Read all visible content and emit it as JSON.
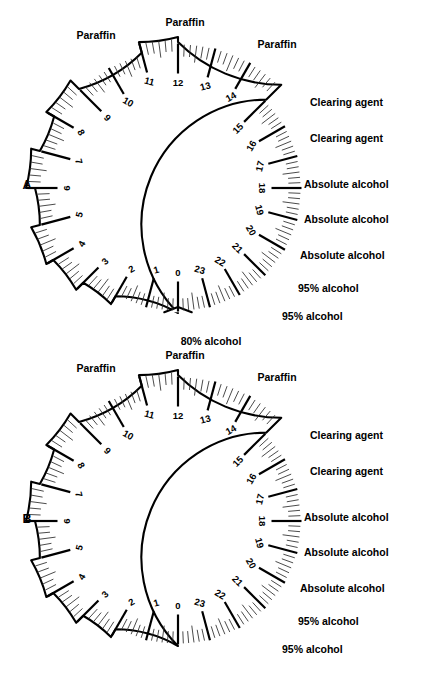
{
  "figure": {
    "background_color": "#ffffff",
    "ink_color": "#000000",
    "panels": [
      {
        "id": "A",
        "letter": "A",
        "center": {
          "x": 178,
          "y": 188
        },
        "inner_radius": 125,
        "letter_pos": {
          "x": 27,
          "y": 189
        },
        "has_bottom_notch": true,
        "hours": [
          0,
          1,
          2,
          3,
          4,
          5,
          6,
          7,
          8,
          9,
          10,
          11,
          12,
          13,
          14,
          15,
          16,
          17,
          18,
          19,
          20,
          21,
          22,
          23
        ],
        "hour_labels": [
          "0",
          "1",
          "2",
          "3",
          "4",
          "5",
          "6",
          "7",
          "8",
          "9",
          "10",
          "11",
          "12",
          "13",
          "14",
          "15",
          "16",
          "17",
          "18",
          "19",
          "20",
          "21",
          "22",
          "23"
        ],
        "steps": [
          {
            "from_hour": 0,
            "to_hour": 2,
            "radius": 125,
            "station": "80% alcohol"
          },
          {
            "from_hour": 2,
            "to_hour": 3,
            "radius": 134,
            "station": "95% alcohol"
          },
          {
            "from_hour": 3,
            "to_hour": 4,
            "radius": 144,
            "station": "95% alcohol"
          },
          {
            "from_hour": 4,
            "to_hour": 5,
            "radius": 152,
            "station": "Absolute alcohol"
          },
          {
            "from_hour": 5,
            "to_hour": 6,
            "radius": 143,
            "station": "Absolute alcohol"
          },
          {
            "from_hour": 6,
            "to_hour": 7,
            "radius": 152,
            "station": "Absolute alcohol"
          },
          {
            "from_hour": 7,
            "to_hour": 8,
            "radius": 143,
            "station": "Clearing agent"
          },
          {
            "from_hour": 8,
            "to_hour": 9,
            "radius": 152,
            "station": "Clearing agent"
          },
          {
            "from_hour": 9,
            "to_hour": 11,
            "radius": 140,
            "station": "Paraffin"
          },
          {
            "from_hour": 11,
            "to_hour": 12,
            "radius": 151,
            "station": "Paraffin"
          },
          {
            "from_hour": 12,
            "to_hour": 15,
            "radius": 146,
            "station": "Paraffin"
          },
          {
            "from_hour": 15,
            "to_hour": 24,
            "radius": 125,
            "station": ""
          }
        ],
        "side_labels": [
          {
            "text": "Clearing agent",
            "x": 310,
            "y": 106
          },
          {
            "text": "Clearing agent",
            "x": 310,
            "y": 142
          },
          {
            "text": "Absolute alcohol",
            "x": 304,
            "y": 188
          },
          {
            "text": "Absolute alcohol",
            "x": 304,
            "y": 223
          },
          {
            "text": "Absolute alcohol",
            "x": 300,
            "y": 259
          },
          {
            "text": "95% alcohol",
            "x": 298,
            "y": 292
          },
          {
            "text": "95% alcohol",
            "x": 282,
            "y": 320
          }
        ],
        "top_labels": [
          {
            "text": "Paraffin",
            "x": 96,
            "y": 39
          },
          {
            "text": "Paraffin",
            "x": 185,
            "y": 26
          },
          {
            "text": "Paraffin",
            "x": 277,
            "y": 48
          }
        ],
        "bottom_labels": [
          {
            "text": "80% alcohol",
            "x": 211,
            "y": 345
          }
        ]
      },
      {
        "id": "B",
        "letter": "B",
        "center": {
          "x": 178,
          "y": 521
        },
        "inner_radius": 125,
        "letter_pos": {
          "x": 27,
          "y": 523
        },
        "has_bottom_notch": false,
        "hours": [
          0,
          1,
          2,
          3,
          4,
          5,
          6,
          7,
          8,
          9,
          10,
          11,
          12,
          13,
          14,
          15,
          16,
          17,
          18,
          19,
          20,
          21,
          22,
          23
        ],
        "hour_labels": [
          "0",
          "1",
          "2",
          "3",
          "4",
          "5",
          "6",
          "7",
          "8",
          "9",
          "10",
          "11",
          "12",
          "13",
          "14",
          "15",
          "16",
          "17",
          "18",
          "19",
          "20",
          "21",
          "22",
          "23"
        ],
        "steps": [
          {
            "from_hour": 0,
            "to_hour": 2,
            "radius": 125,
            "station": ""
          },
          {
            "from_hour": 2,
            "to_hour": 3,
            "radius": 134,
            "station": "95% alcohol"
          },
          {
            "from_hour": 3,
            "to_hour": 4,
            "radius": 144,
            "station": "95% alcohol"
          },
          {
            "from_hour": 4,
            "to_hour": 5,
            "radius": 152,
            "station": "Absolute alcohol"
          },
          {
            "from_hour": 5,
            "to_hour": 6,
            "radius": 143,
            "station": "Absolute alcohol"
          },
          {
            "from_hour": 6,
            "to_hour": 7,
            "radius": 152,
            "station": "Absolute alcohol"
          },
          {
            "from_hour": 7,
            "to_hour": 8,
            "radius": 143,
            "station": "Clearing agent"
          },
          {
            "from_hour": 8,
            "to_hour": 9,
            "radius": 152,
            "station": "Clearing agent"
          },
          {
            "from_hour": 9,
            "to_hour": 11,
            "radius": 140,
            "station": "Paraffin"
          },
          {
            "from_hour": 11,
            "to_hour": 12,
            "radius": 151,
            "station": "Paraffin"
          },
          {
            "from_hour": 12,
            "to_hour": 15,
            "radius": 146,
            "station": "Paraffin"
          },
          {
            "from_hour": 15,
            "to_hour": 24,
            "radius": 125,
            "station": ""
          }
        ],
        "side_labels": [
          {
            "text": "Clearing agent",
            "x": 310,
            "y": 439
          },
          {
            "text": "Clearing agent",
            "x": 310,
            "y": 475
          },
          {
            "text": "Absolute alcohol",
            "x": 304,
            "y": 521
          },
          {
            "text": "Absolute alcohol",
            "x": 304,
            "y": 556
          },
          {
            "text": "Absolute alcohol",
            "x": 300,
            "y": 592
          },
          {
            "text": "95% alcohol",
            "x": 298,
            "y": 625
          },
          {
            "text": "95% alcohol",
            "x": 282,
            "y": 653
          }
        ],
        "top_labels": [
          {
            "text": "Paraffin",
            "x": 96,
            "y": 372
          },
          {
            "text": "Paraffin",
            "x": 185,
            "y": 359
          },
          {
            "text": "Paraffin",
            "x": 277,
            "y": 381
          }
        ],
        "bottom_labels": []
      }
    ]
  },
  "chart_data": {
    "type": "table",
    "xlabel": "Hour of cycle",
    "ylabel": "Processing station",
    "categories": [
      "0",
      "1",
      "2",
      "3",
      "4",
      "5",
      "6",
      "7",
      "8",
      "9",
      "10",
      "11",
      "12",
      "13",
      "14",
      "15",
      "16",
      "17",
      "18",
      "19",
      "20",
      "21",
      "22",
      "23"
    ],
    "series": [
      {
        "name": "A",
        "values": [
          "80% alcohol",
          "80% alcohol",
          "95% alcohol",
          "95% alcohol",
          "Absolute alcohol",
          "Absolute alcohol",
          "Absolute alcohol",
          "Clearing agent",
          "Clearing agent",
          "Paraffin",
          "Paraffin",
          "Paraffin",
          "Paraffin",
          "Paraffin",
          "Paraffin",
          "",
          "",
          "",
          "",
          "",
          "",
          "",
          "",
          ""
        ]
      },
      {
        "name": "B",
        "values": [
          "",
          "",
          "95% alcohol",
          "95% alcohol",
          "Absolute alcohol",
          "Absolute alcohol",
          "Absolute alcohol",
          "Clearing agent",
          "Clearing agent",
          "Paraffin",
          "Paraffin",
          "Paraffin",
          "Paraffin",
          "Paraffin",
          "Paraffin",
          "",
          "",
          "",
          "",
          "",
          "",
          "",
          "",
          ""
        ]
      }
    ],
    "legend_position": "none",
    "grid": false
  }
}
